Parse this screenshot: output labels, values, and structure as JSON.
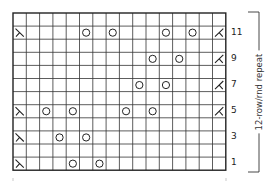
{
  "chart_title": "",
  "grid": {
    "columns": 16,
    "rows": 12,
    "left": 13,
    "top": 13,
    "cell_w": 13.3,
    "cell_h": 13.1,
    "line_color": "#333333",
    "border_color": "#222222"
  },
  "row_labels": [
    "11",
    "9",
    "7",
    "5",
    "3",
    "1"
  ],
  "repeat_label": "12-row/rnd repeat",
  "legend_symbols": {
    "O": "yo-icon",
    "L": "left-decrease-icon",
    "R": "right-decrease-icon"
  },
  "chart_data": {
    "type": "table",
    "columns": 16,
    "rows": 12,
    "row_numbering": "odd rows labeled on right, read bottom-up",
    "rows_top_to_bottom": [
      {
        "row": 12,
        "cells": {}
      },
      {
        "row": 11,
        "cells": {
          "1": "L",
          "6": "O",
          "8": "O",
          "12": "O",
          "14": "O",
          "16": "R"
        }
      },
      {
        "row": 10,
        "cells": {}
      },
      {
        "row": 9,
        "cells": {
          "11": "O",
          "13": "O",
          "16": "R"
        }
      },
      {
        "row": 8,
        "cells": {}
      },
      {
        "row": 7,
        "cells": {
          "10": "O",
          "12": "O",
          "16": "R"
        }
      },
      {
        "row": 6,
        "cells": {}
      },
      {
        "row": 5,
        "cells": {
          "1": "L",
          "3": "O",
          "5": "O",
          "9": "O",
          "11": "O",
          "16": "R"
        }
      },
      {
        "row": 4,
        "cells": {}
      },
      {
        "row": 3,
        "cells": {
          "1": "L",
          "4": "O",
          "6": "O"
        }
      },
      {
        "row": 2,
        "cells": {}
      },
      {
        "row": 1,
        "cells": {
          "1": "L",
          "5": "O",
          "7": "O"
        }
      }
    ],
    "annotations": [
      "12-row/rnd repeat"
    ]
  }
}
